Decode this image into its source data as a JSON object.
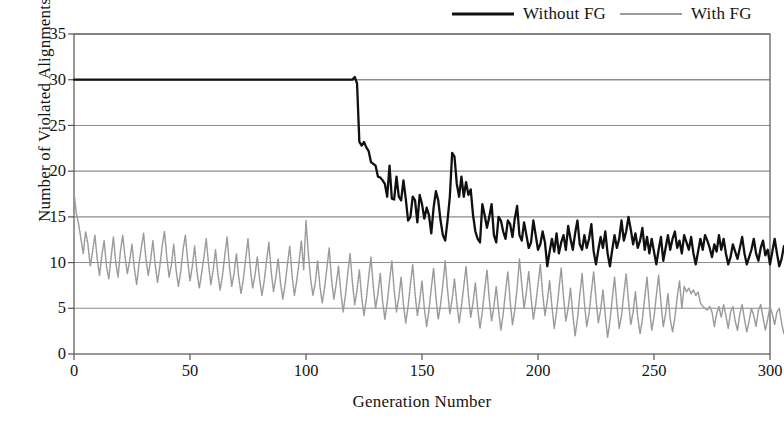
{
  "chart_data": {
    "type": "line",
    "title": "",
    "xlabel": "Generation Number",
    "ylabel": "Number of Violated Alignments",
    "xlim": [
      0,
      300
    ],
    "ylim": [
      0,
      35
    ],
    "xticks": [
      0,
      50,
      100,
      150,
      200,
      250,
      300
    ],
    "yticks": [
      0,
      5,
      10,
      15,
      20,
      25,
      30,
      35
    ],
    "grid": "horizontal",
    "legend_position": "top-right",
    "colors": {
      "without_fg": "#101010",
      "with_fg": "#9a9a9a",
      "grid": "#8c8c8c",
      "frame": "#555555"
    },
    "series": [
      {
        "name": "Without FG",
        "style": "solid-thick",
        "color": "#101010",
        "x_start": 0,
        "x_step": 1,
        "values": [
          30,
          30,
          30,
          30,
          30,
          30,
          30,
          30,
          30,
          30,
          30,
          30,
          30,
          30,
          30,
          30,
          30,
          30,
          30,
          30,
          30,
          30,
          30,
          30,
          30,
          30,
          30,
          30,
          30,
          30,
          30,
          30,
          30,
          30,
          30,
          30,
          30,
          30,
          30,
          30,
          30,
          30,
          30,
          30,
          30,
          30,
          30,
          30,
          30,
          30,
          30,
          30,
          30,
          30,
          30,
          30,
          30,
          30,
          30,
          30,
          30,
          30,
          30,
          30,
          30,
          30,
          30,
          30,
          30,
          30,
          30,
          30,
          30,
          30,
          30,
          30,
          30,
          30,
          30,
          30,
          30,
          30,
          30,
          30,
          30,
          30,
          30,
          30,
          30,
          30,
          30,
          30,
          30,
          30,
          30,
          30,
          30,
          30,
          30,
          30,
          30,
          30,
          30,
          30,
          30,
          30,
          30,
          30,
          30,
          30,
          30,
          30,
          30,
          30,
          30,
          30,
          30,
          30,
          30,
          30,
          30,
          30.3,
          29.6,
          23.2,
          22.8,
          23.2,
          22.6,
          22.2,
          21.0,
          20.8,
          20.6,
          19.4,
          19.3,
          19.0,
          18.6,
          17.2,
          20.6,
          17.0,
          16.9,
          19.4,
          17.2,
          16.8,
          19.0,
          17.0,
          14.6,
          15.0,
          17.2,
          16.8,
          14.4,
          17.4,
          16.4,
          14.8,
          16.0,
          15.2,
          13.2,
          16.0,
          17.8,
          16.8,
          14.6,
          13.0,
          12.4,
          14.6,
          17.2,
          22.0,
          21.6,
          18.6,
          17.2,
          19.4,
          17.2,
          18.8,
          17.4,
          18.0,
          15.2,
          13.4,
          12.6,
          12.2,
          16.4,
          15.2,
          13.8,
          15.0,
          16.4,
          13.0,
          12.2,
          15.0,
          14.6,
          13.4,
          12.6,
          14.6,
          14.2,
          12.8,
          14.8,
          16.2,
          13.0,
          12.4,
          14.4,
          13.0,
          11.6,
          12.2,
          14.6,
          13.0,
          11.4,
          12.0,
          13.4,
          12.2,
          9.6,
          11.2,
          12.6,
          11.2,
          13.2,
          11.0,
          12.2,
          13.0,
          11.4,
          14.0,
          12.6,
          11.4,
          13.2,
          14.6,
          12.0,
          11.4,
          13.0,
          11.6,
          12.6,
          14.2,
          11.2,
          9.8,
          11.4,
          12.8,
          11.6,
          13.4,
          11.0,
          9.6,
          11.4,
          13.0,
          11.6,
          12.6,
          14.6,
          12.4,
          13.4,
          15.0,
          13.6,
          12.0,
          13.2,
          11.6,
          12.4,
          13.8,
          11.4,
          12.8,
          11.0,
          12.6,
          11.2,
          9.8,
          11.4,
          12.8,
          10.2,
          11.6,
          13.0,
          11.4,
          12.6,
          13.4,
          11.6,
          12.4,
          11.0,
          13.0,
          12.2,
          11.4,
          12.8,
          11.0,
          9.8,
          11.2,
          12.6,
          11.4,
          13.0,
          12.4,
          11.6,
          10.6,
          12.0,
          11.2,
          13.0,
          11.4,
          12.6,
          11.0,
          9.8,
          10.6,
          12.0,
          11.2,
          10.4,
          11.6,
          12.8,
          11.0,
          9.8,
          10.6,
          11.4,
          12.6,
          11.0,
          10.2,
          11.6,
          12.4,
          10.8,
          11.4,
          9.8,
          11.2,
          12.6,
          11.0,
          9.6,
          10.4,
          11.8,
          10.6,
          9.4,
          10.8
        ]
      },
      {
        "name": "With FG",
        "style": "dotted-thin",
        "color": "#9a9a9a",
        "x_start": 0,
        "x_step": 1,
        "values": [
          17.6,
          15.4,
          14.2,
          12.6,
          11.0,
          13.4,
          12.0,
          9.6,
          11.2,
          13.0,
          10.4,
          8.6,
          10.8,
          12.4,
          9.6,
          8.2,
          10.6,
          12.8,
          10.0,
          8.4,
          11.2,
          13.0,
          10.6,
          8.8,
          10.2,
          12.0,
          9.4,
          7.6,
          9.8,
          11.6,
          13.2,
          10.4,
          8.6,
          10.2,
          12.4,
          9.8,
          7.8,
          9.6,
          11.8,
          13.4,
          10.6,
          8.4,
          9.8,
          12.0,
          9.2,
          7.4,
          9.0,
          11.4,
          13.0,
          10.2,
          8.0,
          9.6,
          11.8,
          9.0,
          7.2,
          8.8,
          10.6,
          12.6,
          9.8,
          7.6,
          9.2,
          11.4,
          8.8,
          7.0,
          8.6,
          10.8,
          12.8,
          9.6,
          7.4,
          8.8,
          11.0,
          8.4,
          6.6,
          8.2,
          10.4,
          12.6,
          9.4,
          7.2,
          8.6,
          10.6,
          8.2,
          6.4,
          8.0,
          10.2,
          12.2,
          9.0,
          6.8,
          8.4,
          10.4,
          7.8,
          6.0,
          7.6,
          9.8,
          11.8,
          8.6,
          6.4,
          8.0,
          10.0,
          12.4,
          9.2,
          14.6,
          11.0,
          8.2,
          6.4,
          7.8,
          10.2,
          7.4,
          5.6,
          7.2,
          9.4,
          11.6,
          8.2,
          6.0,
          7.6,
          9.6,
          6.8,
          4.6,
          6.4,
          8.8,
          11.0,
          7.8,
          5.4,
          7.0,
          9.2,
          6.2,
          4.2,
          6.0,
          8.4,
          10.6,
          7.4,
          5.0,
          6.6,
          8.8,
          5.8,
          3.8,
          5.6,
          8.0,
          10.2,
          7.0,
          4.6,
          6.2,
          8.4,
          5.4,
          3.4,
          5.2,
          7.6,
          9.8,
          6.6,
          4.2,
          5.8,
          8.0,
          5.0,
          3.0,
          4.8,
          7.2,
          9.4,
          6.2,
          3.8,
          5.4,
          7.6,
          10.2,
          7.0,
          4.4,
          6.0,
          8.2,
          5.6,
          3.4,
          5.2,
          7.4,
          9.6,
          6.4,
          4.0,
          5.6,
          7.8,
          5.0,
          2.8,
          4.6,
          7.0,
          9.2,
          6.0,
          3.6,
          5.2,
          7.4,
          4.8,
          2.6,
          4.4,
          6.8,
          9.0,
          5.8,
          3.2,
          4.8,
          7.2,
          10.4,
          7.6,
          5.0,
          6.8,
          9.0,
          6.2,
          3.8,
          5.4,
          7.6,
          9.8,
          6.6,
          4.2,
          5.8,
          8.0,
          5.2,
          2.8,
          4.6,
          7.0,
          9.4,
          6.2,
          3.6,
          5.0,
          7.2,
          4.4,
          2.0,
          3.8,
          6.4,
          8.8,
          5.6,
          3.0,
          4.4,
          6.8,
          9.0,
          6.0,
          3.4,
          4.8,
          7.0,
          4.2,
          1.8,
          3.6,
          6.0,
          8.4,
          5.4,
          2.8,
          4.2,
          6.6,
          8.8,
          5.8,
          3.2,
          4.6,
          6.8,
          4.0,
          2.2,
          3.8,
          6.2,
          8.4,
          5.2,
          2.6,
          4.0,
          6.4,
          8.6,
          5.6,
          3.0,
          4.4,
          6.6,
          3.8,
          2.4,
          4.0,
          6.2,
          8.0,
          5.0,
          7.4,
          6.8,
          7.2,
          6.6,
          7.0,
          6.4,
          6.8,
          5.6,
          5.2,
          5.0,
          4.8,
          5.2,
          4.6,
          3.0,
          4.4,
          5.2,
          4.0,
          5.4,
          4.2,
          2.8,
          4.6,
          5.2,
          3.6,
          2.6,
          4.4,
          5.4,
          3.8,
          2.4,
          3.6,
          5.0,
          4.2,
          3.0,
          4.8,
          5.4,
          4.0,
          2.6,
          3.8,
          5.2,
          4.4,
          3.2,
          4.6,
          5.0,
          3.4,
          2.2,
          3.6,
          4.4,
          3.2
        ]
      }
    ]
  },
  "legend": {
    "entries": [
      {
        "label": "Without FG",
        "swatch": "thick-black-line"
      },
      {
        "label": "With FG",
        "swatch": "thin-gray-line"
      }
    ]
  },
  "axes": {
    "y_title": "Number of Violated Alignments",
    "x_title": "Generation Number",
    "y_tick_labels": [
      "35",
      "30",
      "25",
      "20",
      "15",
      "10",
      "5",
      "0"
    ],
    "x_tick_labels": [
      "0",
      "50",
      "100",
      "150",
      "200",
      "250",
      "300"
    ]
  }
}
